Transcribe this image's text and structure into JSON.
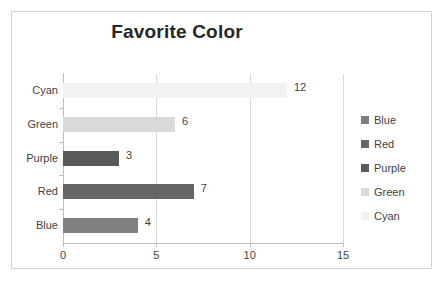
{
  "chart_data": {
    "type": "bar",
    "orientation": "horizontal",
    "title": "Favorite Color",
    "xlabel": "",
    "ylabel": "",
    "categories": [
      "Blue",
      "Red",
      "Purple",
      "Green",
      "Cyan"
    ],
    "values": [
      4,
      7,
      3,
      6,
      12
    ],
    "data_labels": [
      "4",
      "7",
      "3",
      "6",
      "12"
    ],
    "display_order_top_to_bottom": [
      "Cyan",
      "Green",
      "Purple",
      "Red",
      "Blue"
    ],
    "xlim": [
      0,
      15
    ],
    "xticks": [
      0,
      5,
      10,
      15
    ],
    "xtick_labels": [
      "0",
      "5",
      "10",
      "15"
    ],
    "grid": "vertical",
    "legend_position": "right",
    "legend": [
      {
        "label": "Blue",
        "color": "#808080"
      },
      {
        "label": "Red",
        "color": "#666666"
      },
      {
        "label": "Purple",
        "color": "#595959"
      },
      {
        "label": "Green",
        "color": "#d9d9d9"
      },
      {
        "label": "Cyan",
        "color": "#f2f2f2"
      }
    ],
    "bars": [
      {
        "category": "Cyan",
        "value": 12,
        "label": "12",
        "color": "#f2f2f2"
      },
      {
        "category": "Green",
        "value": 6,
        "label": "6",
        "color": "#d9d9d9"
      },
      {
        "category": "Purple",
        "value": 3,
        "label": "3",
        "color": "#595959"
      },
      {
        "category": "Red",
        "value": 7,
        "label": "7",
        "color": "#666666"
      },
      {
        "category": "Blue",
        "value": 4,
        "label": "4",
        "color": "#808080"
      }
    ],
    "colors": {
      "plot_border": "#d4d4d4",
      "axis": "#bfbfbf",
      "gridline": "#d9d9d9",
      "text": "#3f3f3f",
      "title_text": "#262626",
      "background": "#ffffff"
    }
  }
}
